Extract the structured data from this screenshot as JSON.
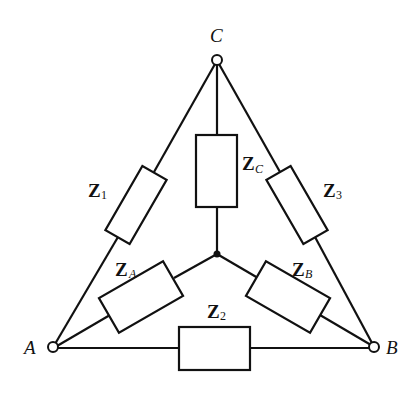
{
  "diagram": {
    "type": "delta-wye impedance network",
    "nodes": {
      "A": {
        "label": "A"
      },
      "B": {
        "label": "B"
      },
      "C": {
        "label": "C"
      }
    },
    "delta_impedances": [
      {
        "id": "Z1",
        "main": "Z",
        "sub": "1",
        "between": "A-C"
      },
      {
        "id": "Z2",
        "main": "Z",
        "sub": "2",
        "between": "A-B"
      },
      {
        "id": "Z3",
        "main": "Z",
        "sub": "3",
        "between": "B-C"
      }
    ],
    "wye_impedances": [
      {
        "id": "ZA",
        "main": "Z",
        "sub": "A",
        "between": "A-N"
      },
      {
        "id": "ZB",
        "main": "Z",
        "sub": "B",
        "between": "B-N"
      },
      {
        "id": "ZC",
        "main": "Z",
        "sub": "C",
        "between": "C-N"
      }
    ]
  }
}
